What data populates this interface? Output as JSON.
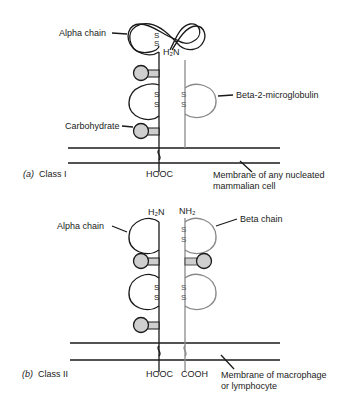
{
  "figure": {
    "class_i": {
      "panel_label": "(a)",
      "title": "Class I",
      "alpha_label": "Alpha chain",
      "beta2m_label": "Beta-2-microglobulin",
      "carbohydrate_label": "Carbohydrate",
      "n_terminus": "H₂N",
      "c_terminus": "HOOC",
      "membrane_label_line1": "Membrane of any nucleated",
      "membrane_label_line2": "mammalian cell",
      "disulfide": "S",
      "colors": {
        "alpha": "#1a1a1a",
        "beta": "#8a8a8a",
        "carbohydrate": "#cfcfcf"
      }
    },
    "class_ii": {
      "panel_label": "(b)",
      "title": "Class II",
      "alpha_label": "Alpha chain",
      "beta_label": "Beta chain",
      "alpha_n_terminus": "H₂N",
      "beta_n_terminus": "NH₂",
      "alpha_c_terminus": "HOOC",
      "beta_c_terminus": "COOH",
      "membrane_label_line1": "Membrane of macrophage",
      "membrane_label_line2": "or lymphocyte",
      "disulfide": "S"
    }
  }
}
